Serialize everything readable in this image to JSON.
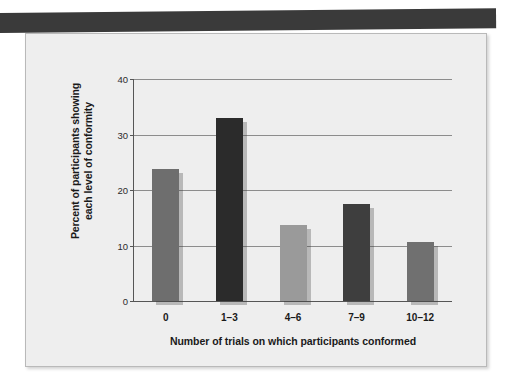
{
  "page": {
    "header_band": "dark-scan-band"
  },
  "chart_data": {
    "type": "bar",
    "title": "",
    "categories": [
      "0",
      "1–3",
      "4–6",
      "7–9",
      "10–12"
    ],
    "values": [
      23.8,
      33.0,
      13.7,
      17.5,
      10.6
    ],
    "xlabel": "Number of trials on which participants conformed",
    "ylabel": "Percent of participants showing each level of conformity",
    "ylabel_line1": "Percent of participants showing",
    "ylabel_line2": "each level of conformity",
    "ylim": [
      0,
      40
    ],
    "yticks": [
      0,
      10,
      20,
      30,
      40
    ],
    "ytick_labels": [
      "0",
      "10",
      "20",
      "30",
      "40"
    ],
    "grid": true,
    "legend": "none",
    "bar_colors": [
      "#6e6e6e",
      "#2b2b2b",
      "#9a9a9a",
      "#3e3e3e",
      "#707070"
    ],
    "plot_bg": "#eeeeee",
    "grid_color": "#8c8c8c",
    "axis_color": "#555555"
  }
}
